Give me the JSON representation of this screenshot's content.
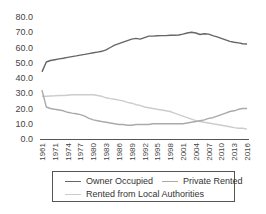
{
  "chart_data": {
    "type": "line",
    "title": "",
    "xlabel": "",
    "ylabel": "",
    "ylim": [
      0,
      80
    ],
    "yticks": [
      "0.0",
      "10.0",
      "20.0",
      "30.0",
      "40.0",
      "50.0",
      "60.0",
      "70.0",
      "80.0"
    ],
    "x": [
      "1961",
      "1969",
      "1970",
      "1971",
      "1972",
      "1973",
      "1974",
      "1975",
      "1976",
      "1977",
      "1978",
      "1979",
      "1980",
      "1981",
      "1982",
      "1983",
      "1984",
      "1985",
      "1986",
      "1987",
      "1988",
      "1989",
      "1990",
      "1991",
      "1992",
      "1993",
      "1994",
      "1995",
      "1996",
      "1997",
      "1998",
      "1999",
      "2000",
      "2001",
      "2002",
      "2003",
      "2004",
      "2005",
      "2006",
      "2007",
      "2008",
      "2009",
      "2010",
      "2011",
      "2012",
      "2013",
      "2014",
      "2015",
      "2016"
    ],
    "xtick_labels": [
      "1961",
      "1971",
      "1974",
      "1977",
      "1980",
      "1983",
      "1986",
      "1989",
      "1992",
      "1995",
      "1998",
      "2001",
      "2004",
      "2007",
      "2010",
      "2013",
      "2016"
    ],
    "grid": false,
    "legend_position": "bottom",
    "series": [
      {
        "name": "Owner Occupied",
        "color": "#666666",
        "values": [
          44.0,
          50.5,
          51.5,
          52.0,
          52.5,
          53.0,
          53.5,
          54.0,
          54.5,
          55.0,
          55.5,
          56.0,
          56.5,
          57.0,
          57.5,
          58.5,
          60.0,
          61.5,
          62.5,
          63.5,
          64.5,
          65.5,
          66.0,
          65.5,
          66.5,
          67.5,
          67.5,
          67.7,
          67.8,
          67.8,
          68.0,
          68.0,
          68.2,
          68.8,
          69.5,
          70.0,
          69.5,
          68.5,
          69.0,
          68.8,
          67.8,
          67.0,
          66.0,
          65.0,
          64.0,
          63.5,
          63.0,
          62.5,
          62.3
        ]
      },
      {
        "name": "Private Rented",
        "color": "#aaaaaa",
        "values": [
          32.0,
          21.0,
          20.0,
          19.5,
          19.0,
          18.5,
          17.5,
          17.0,
          16.5,
          16.0,
          15.0,
          13.5,
          12.5,
          12.0,
          11.5,
          11.0,
          10.5,
          10.0,
          9.5,
          9.5,
          9.0,
          9.0,
          9.5,
          9.5,
          9.5,
          9.5,
          10.0,
          10.0,
          10.0,
          10.0,
          10.0,
          10.0,
          10.0,
          10.0,
          10.5,
          11.0,
          11.5,
          12.0,
          12.5,
          13.5,
          14.0,
          15.0,
          16.0,
          17.0,
          18.0,
          18.5,
          19.5,
          20.0,
          20.0
        ]
      },
      {
        "name": "Rented from Local Authorities",
        "color": "#cccccc",
        "values": [
          28.0,
          28.0,
          28.2,
          28.3,
          28.5,
          28.5,
          28.7,
          29.0,
          29.0,
          29.0,
          29.0,
          29.0,
          29.0,
          28.5,
          28.0,
          27.0,
          26.5,
          26.0,
          25.5,
          25.0,
          24.0,
          23.5,
          22.5,
          22.0,
          21.0,
          20.5,
          20.0,
          19.5,
          19.0,
          18.5,
          18.0,
          17.0,
          16.0,
          15.0,
          14.0,
          13.0,
          12.0,
          11.5,
          11.0,
          10.5,
          10.0,
          9.5,
          9.0,
          8.5,
          8.0,
          7.5,
          7.0,
          7.0,
          6.5
        ]
      }
    ]
  },
  "legend": {
    "items": [
      {
        "label": "Owner Occupied",
        "color": "#666666"
      },
      {
        "label": "Private Rented",
        "color": "#aaaaaa"
      },
      {
        "label": "Rented from Local Authorities",
        "color": "#cccccc"
      }
    ]
  }
}
